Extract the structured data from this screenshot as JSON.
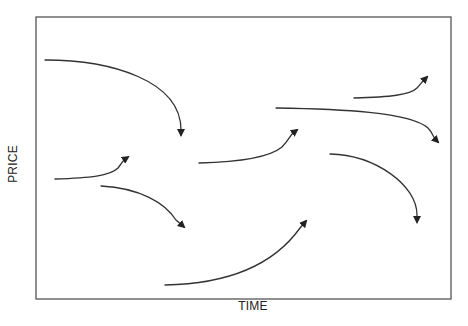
{
  "diagram": {
    "x_axis_label": "TIME",
    "y_axis_label": "PRICE",
    "frame": {
      "x": 36,
      "y": 17,
      "width": 415,
      "height": 282,
      "color": "#555555"
    },
    "stroke_color": "#333333",
    "arrows": [
      {
        "id": "arrow-1",
        "direction": "down",
        "path": "M45,60 C110,60 181,80 181,130",
        "head": [
          181,
          135
        ]
      },
      {
        "id": "arrow-2",
        "direction": "up",
        "path": "M55,179 C90,178 110,176 118,168 C121,164 123,161 125,159",
        "head": [
          128,
          157
        ]
      },
      {
        "id": "arrow-3",
        "direction": "down",
        "path": "M101,186 C140,188 165,203 176,220",
        "head": [
          184,
          227
        ]
      },
      {
        "id": "arrow-4",
        "direction": "up",
        "path": "M165,285 C220,284 270,270 300,228",
        "head": [
          306,
          221
        ]
      },
      {
        "id": "arrow-5",
        "direction": "up",
        "path": "M199,163 C240,162 270,157 282,147 C288,141 290,136 293,133",
        "head": [
          297,
          130
        ]
      },
      {
        "id": "arrow-6",
        "direction": "down",
        "path": "M276,108 C340,109 410,112 428,128 C432,132 433,136 435,139",
        "head": [
          438,
          142
        ]
      },
      {
        "id": "arrow-7",
        "direction": "up",
        "path": "M354,98 C390,97 410,95 417,88 C420,85 422,82 424,80",
        "head": [
          427,
          77
        ]
      },
      {
        "id": "arrow-8",
        "direction": "down",
        "path": "M330,154 C375,155 417,185 417,215",
        "head": [
          417,
          222
        ]
      }
    ]
  }
}
